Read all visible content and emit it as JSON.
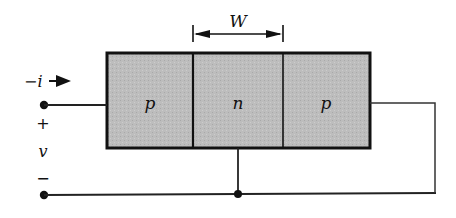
{
  "diagram": {
    "type": "pnp-transistor-structure",
    "regions": [
      {
        "label": "p",
        "role": "emitter-side"
      },
      {
        "label": "n",
        "role": "base"
      },
      {
        "label": "p",
        "role": "collector-side"
      }
    ],
    "width_label": "W",
    "current_label": "−i",
    "voltage": {
      "plus": "+",
      "symbol": "v",
      "minus": "−"
    }
  },
  "colors": {
    "region_fill": "#b9b9b9",
    "outline": "#111111",
    "wire": "#222222",
    "background": "#ffffff"
  }
}
